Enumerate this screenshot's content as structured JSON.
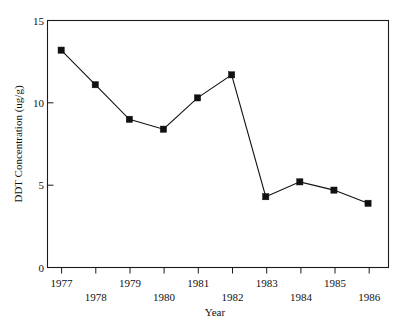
{
  "chart_data": {
    "type": "line",
    "title": "",
    "subtitle": "",
    "xlabel": "Year",
    "ylabel": "DDT Concentration (ug/g)",
    "categories": [
      "1977",
      "1978",
      "1979",
      "1980",
      "1981",
      "1982",
      "1983",
      "1984",
      "1985",
      "1986"
    ],
    "x": [
      1977,
      1978,
      1979,
      1980,
      1981,
      1982,
      1983,
      1984,
      1985,
      1986
    ],
    "values": [
      13.2,
      11.1,
      9.0,
      8.4,
      10.3,
      11.7,
      4.3,
      5.2,
      4.7,
      3.9
    ],
    "series": [
      {
        "name": "DDT Concentration",
        "values": [
          13.2,
          11.1,
          9.0,
          8.4,
          10.3,
          11.7,
          4.3,
          5.2,
          4.7,
          3.9
        ]
      }
    ],
    "xlim": [
      1976.6,
      1986.6
    ],
    "ylim": [
      0,
      15
    ],
    "ytick_values": [
      0,
      5,
      10,
      15
    ],
    "ytick_labels": [
      "0",
      "5",
      "10",
      "15"
    ],
    "xtick_values": [
      1977,
      1978,
      1979,
      1980,
      1981,
      1982,
      1983,
      1984,
      1985,
      1986
    ],
    "xtick_labels_top_row": [
      "1977",
      "1979",
      "1981",
      "1983",
      "1985"
    ],
    "xtick_labels_bottom_row": [
      "1978",
      "1980",
      "1982",
      "1984",
      "1986"
    ],
    "grid": false,
    "legend": false,
    "legend_position": "none",
    "marker": "square",
    "line_color": "#111111",
    "marker_color": "#111111",
    "axis_color": "#1a1a1a",
    "background_color": "#ffffff"
  },
  "axes": {
    "y_title": "DDT Concentration (ug/g)",
    "x_title": "Year"
  }
}
